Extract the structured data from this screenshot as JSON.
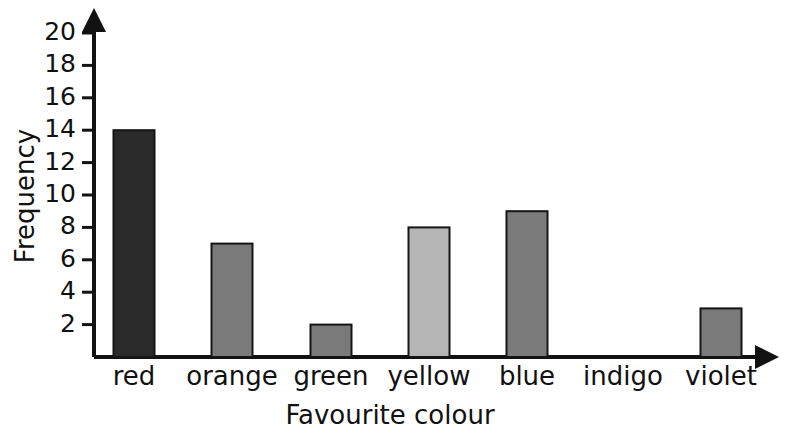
{
  "chart_data": {
    "type": "bar",
    "title": "",
    "subtitle": "",
    "xlabel": "Favourite colour",
    "ylabel": "Frequency",
    "categories": [
      "red",
      "orange",
      "green",
      "yellow",
      "blue",
      "indigo",
      "violet"
    ],
    "values": [
      14,
      7,
      2,
      8,
      9,
      0,
      3
    ],
    "bar_colors": [
      "#2a2a2a",
      "#7a7a7a",
      "#7a7a7a",
      "#b5b5b5",
      "#7a7a7a",
      "#7a7a7a",
      "#7a7a7a"
    ],
    "ylim": [
      0,
      21
    ],
    "y_ticks": [
      2,
      4,
      6,
      8,
      10,
      12,
      14,
      16,
      18,
      20
    ],
    "y_tick_labels": [
      "2",
      "4",
      "6",
      "8",
      "10",
      "12",
      "14",
      "16",
      "18",
      "20"
    ],
    "grid": false,
    "legend": "none",
    "axis_color": "#121212",
    "bar_edge_color": "#151515",
    "background": "#ffffff",
    "x_axis_has_arrow": true,
    "y_axis_has_arrow": true
  },
  "axis_titles": {
    "x": "Favourite colour",
    "y": "Frequency"
  },
  "ticks": {
    "t0": "2",
    "t1": "4",
    "t2": "6",
    "t3": "8",
    "t4": "10",
    "t5": "12",
    "t6": "14",
    "t7": "16",
    "t8": "18",
    "t9": "20"
  },
  "categories": {
    "c0": "red",
    "c1": "orange",
    "c2": "green",
    "c3": "yellow",
    "c4": "blue",
    "c5": "indigo",
    "c6": "violet"
  }
}
